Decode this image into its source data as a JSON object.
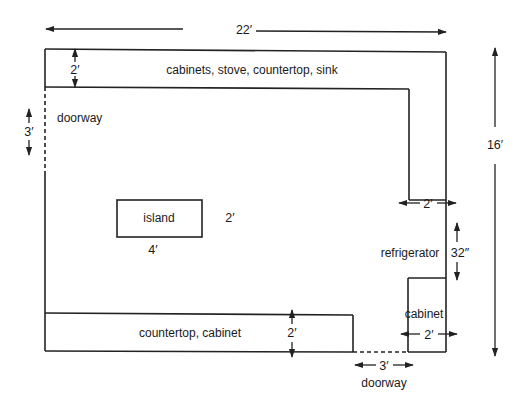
{
  "diagram": {
    "type": "kitchen floor plan",
    "overall_dimensions": {
      "width_label": "22′",
      "height_label": "16′"
    },
    "areas": {
      "top_counter": {
        "label": "cabinets, stove, countertop, sink",
        "depth_label": "2′"
      },
      "left_doorway": {
        "label": "doorway",
        "width_label": "3′"
      },
      "island": {
        "label": "island",
        "width_label": "4′",
        "depth_label": "2′"
      },
      "right_upper_cabinet": {
        "depth_label": "2′"
      },
      "refrigerator": {
        "label": "refrigerator",
        "width_label": "32″"
      },
      "right_lower_cabinet": {
        "label": "cabinet",
        "depth_label": "2′"
      },
      "bottom_counter": {
        "label": "countertop, cabinet",
        "depth_label": "2′"
      },
      "bottom_doorway": {
        "label": "doorway",
        "width_label": "3′"
      }
    },
    "colors": {
      "line": "#222222",
      "background": "#ffffff"
    }
  }
}
